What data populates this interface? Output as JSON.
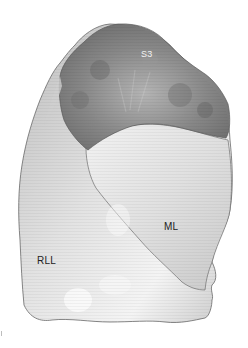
{
  "figure": {
    "labels": {
      "s3": "S3",
      "ml": "ML",
      "rll": "RLL"
    },
    "colors": {
      "background": "#ffffff",
      "lower_lobe": "#d4d4d4",
      "middle_lobe": "#e6e6e6",
      "segment_s3": "#8a8a8a",
      "outline": "#555555"
    }
  }
}
